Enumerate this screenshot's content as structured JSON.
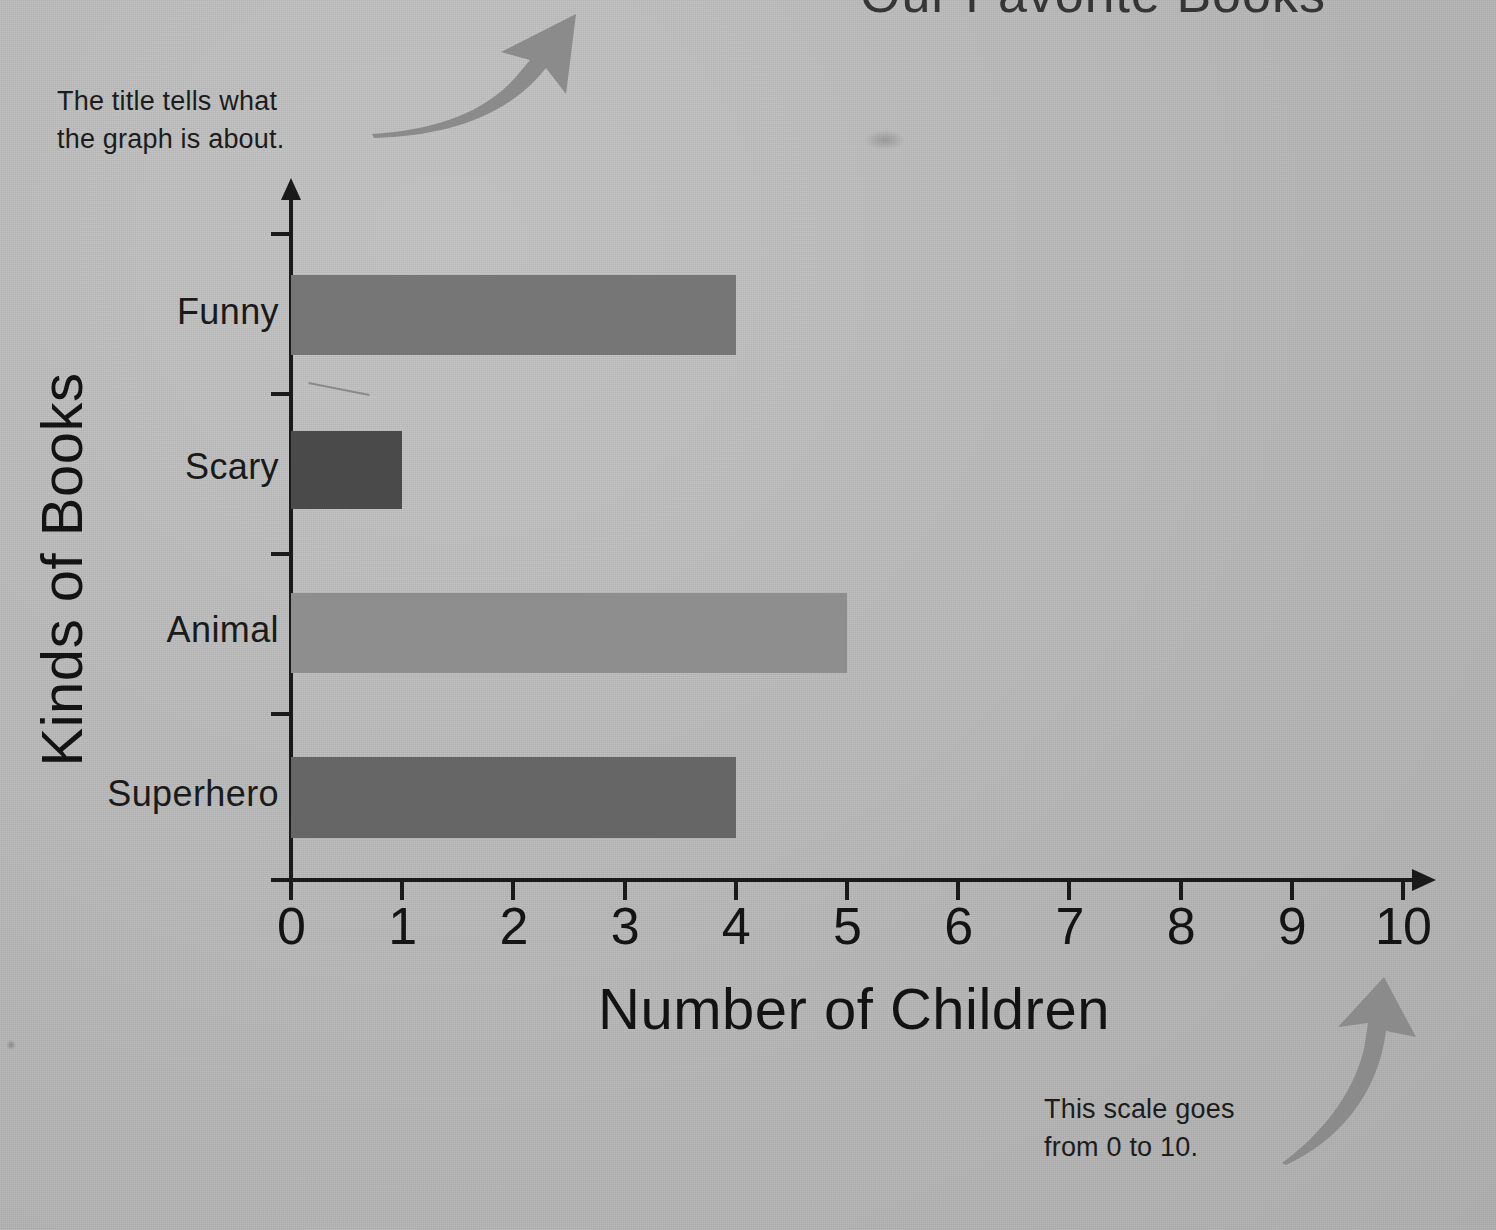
{
  "page": {
    "background_color": "#b9b9b9",
    "cropped_top_title": "Our Favorite Books"
  },
  "annotations": [
    {
      "id": "title-note",
      "text": "The title tells what\nthe graph is about.",
      "arrow": "curved-arrow-up-right-icon"
    },
    {
      "id": "scale-note",
      "text": "This scale goes\nfrom 0 to 10.",
      "arrow": "curved-arrow-up-right-icon"
    }
  ],
  "chart_data": {
    "type": "bar",
    "orientation": "horizontal",
    "title": "Our Favorite Books",
    "xlabel": "Number of Children",
    "ylabel": "Kinds of Books",
    "categories": [
      "Funny",
      "Scary",
      "Animal",
      "Superhero"
    ],
    "values": [
      4,
      1,
      5,
      4
    ],
    "bar_colors": [
      "#767676",
      "#4a4a4a",
      "#8e8e8e",
      "#666666"
    ],
    "xlim": [
      0,
      10
    ],
    "xticks": [
      0,
      1,
      2,
      3,
      4,
      5,
      6,
      7,
      8,
      9,
      10
    ],
    "xtick_labels": [
      "0",
      "1",
      "2",
      "3",
      "4",
      "5",
      "6",
      "7",
      "8",
      "9",
      "10"
    ],
    "grid": false,
    "legend": "none",
    "axis_color": "#1a1a1a"
  },
  "colors": {
    "axis": "#1a1a1a",
    "text": "#141414",
    "arrow": "#8a8a8a",
    "background": "#b9b9b9"
  }
}
